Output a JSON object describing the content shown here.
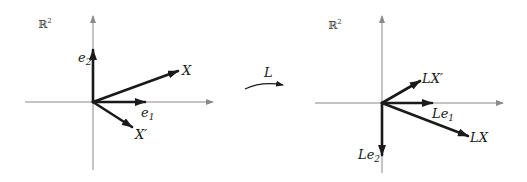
{
  "colors": {
    "axis": "#8a8a8a",
    "vector": "#1a1a1a",
    "background": "#ffffff"
  },
  "left_panel": {
    "space_label": "ℝ",
    "space_exp": "2",
    "origin": [
      93,
      102
    ],
    "vectors": [
      {
        "name": "e2",
        "label": "e",
        "sub": "2",
        "tip": [
          93,
          50
        ]
      },
      {
        "name": "X",
        "label": "X",
        "sub": "",
        "tip": [
          178,
          71
        ]
      },
      {
        "name": "e1",
        "label": "e",
        "sub": "1",
        "tip": [
          145,
          102
        ]
      },
      {
        "name": "X'",
        "label": "X′",
        "sub": "",
        "tip": [
          132,
          127
        ]
      }
    ]
  },
  "map": {
    "label": "L"
  },
  "right_panel": {
    "space_label": "ℝ",
    "space_exp": "2",
    "origin": [
      382,
      103
    ],
    "vectors": [
      {
        "name": "LX'",
        "label": "LX′",
        "sub": "",
        "tip": [
          420,
          81
        ]
      },
      {
        "name": "Le1",
        "label": "Le",
        "sub": "1",
        "tip": [
          432,
          103
        ]
      },
      {
        "name": "LX",
        "label": "LX",
        "sub": "",
        "tip": [
          468,
          136
        ]
      },
      {
        "name": "Le2",
        "label": "Le",
        "sub": "2",
        "tip": [
          382,
          155
        ]
      }
    ]
  }
}
